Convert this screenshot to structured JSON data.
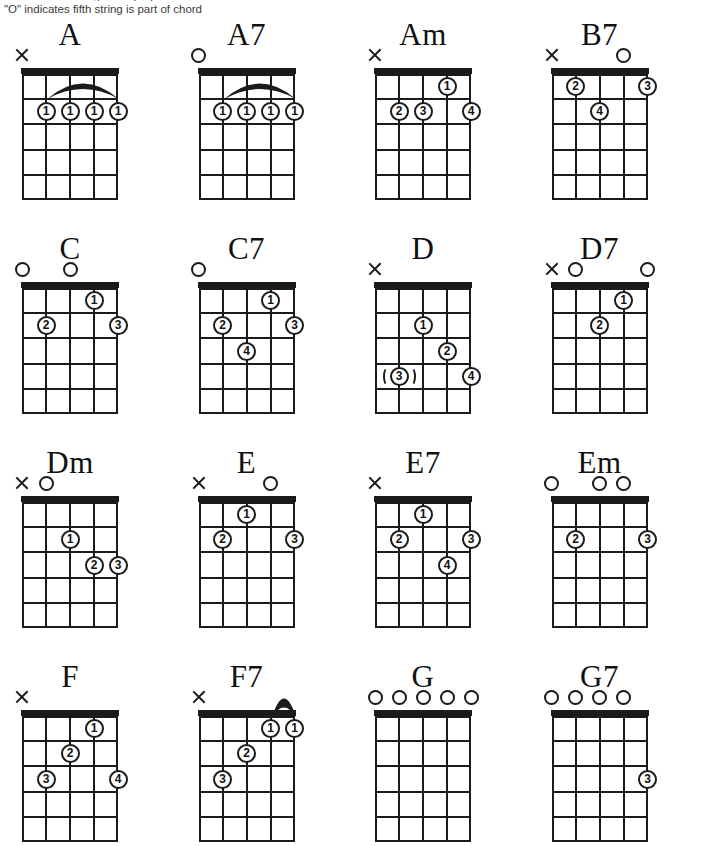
{
  "header": {
    "clipped_line": "\"X\" indicates string is not played",
    "note": "\"O\" indicates fifth string is part of chord"
  },
  "diagram_spec": {
    "strings": 5,
    "frets": 5,
    "marker_open": "O",
    "marker_mute": "X"
  },
  "chords": [
    {
      "name": "A",
      "top_markers": [
        {
          "string": 1,
          "type": "mute"
        }
      ],
      "fingers": [
        {
          "string": 2,
          "fret": 2,
          "label": "1"
        },
        {
          "string": 3,
          "fret": 2,
          "label": "1"
        },
        {
          "string": 4,
          "fret": 2,
          "label": "1"
        },
        {
          "string": 5,
          "fret": 2,
          "label": "1"
        }
      ],
      "barre": {
        "from_string": 2,
        "to_string": 5,
        "fret": 1
      }
    },
    {
      "name": "A7",
      "top_markers": [
        {
          "string": 1,
          "type": "open"
        }
      ],
      "fingers": [
        {
          "string": 2,
          "fret": 2,
          "label": "1"
        },
        {
          "string": 3,
          "fret": 2,
          "label": "1"
        },
        {
          "string": 4,
          "fret": 2,
          "label": "1"
        },
        {
          "string": 5,
          "fret": 2,
          "label": "1"
        }
      ],
      "barre": {
        "from_string": 2,
        "to_string": 5,
        "fret": 1
      }
    },
    {
      "name": "Am",
      "top_markers": [
        {
          "string": 1,
          "type": "mute"
        }
      ],
      "fingers": [
        {
          "string": 4,
          "fret": 1,
          "label": "1"
        },
        {
          "string": 2,
          "fret": 2,
          "label": "2"
        },
        {
          "string": 3,
          "fret": 2,
          "label": "3"
        },
        {
          "string": 5,
          "fret": 2,
          "label": "4"
        }
      ],
      "barre": null
    },
    {
      "name": "B7",
      "top_markers": [
        {
          "string": 1,
          "type": "mute"
        },
        {
          "string": 4,
          "type": "open"
        }
      ],
      "fingers": [
        {
          "string": 2,
          "fret": 1,
          "label": "2"
        },
        {
          "string": 5,
          "fret": 1,
          "label": "3"
        },
        {
          "string": 3,
          "fret": 2,
          "label": "4"
        }
      ],
      "barre": null
    },
    {
      "name": "C",
      "top_markers": [
        {
          "string": 1,
          "type": "open"
        },
        {
          "string": 3,
          "type": "open"
        }
      ],
      "fingers": [
        {
          "string": 4,
          "fret": 1,
          "label": "1"
        },
        {
          "string": 2,
          "fret": 2,
          "label": "2"
        },
        {
          "string": 5,
          "fret": 2,
          "label": "3"
        }
      ],
      "barre": null
    },
    {
      "name": "C7",
      "top_markers": [
        {
          "string": 1,
          "type": "open"
        }
      ],
      "fingers": [
        {
          "string": 4,
          "fret": 1,
          "label": "1"
        },
        {
          "string": 2,
          "fret": 2,
          "label": "2"
        },
        {
          "string": 5,
          "fret": 2,
          "label": "3"
        },
        {
          "string": 3,
          "fret": 3,
          "label": "4"
        }
      ],
      "barre": null
    },
    {
      "name": "D",
      "top_markers": [
        {
          "string": 1,
          "type": "mute"
        }
      ],
      "fingers": [
        {
          "string": 3,
          "fret": 2,
          "label": "1"
        },
        {
          "string": 4,
          "fret": 3,
          "label": "2"
        },
        {
          "string": 2,
          "fret": 4,
          "label": "3",
          "optional": true
        },
        {
          "string": 5,
          "fret": 4,
          "label": "4"
        }
      ],
      "barre": null
    },
    {
      "name": "D7",
      "top_markers": [
        {
          "string": 1,
          "type": "mute"
        },
        {
          "string": 2,
          "type": "open"
        },
        {
          "string": 5,
          "type": "open"
        }
      ],
      "fingers": [
        {
          "string": 4,
          "fret": 1,
          "label": "1"
        },
        {
          "string": 3,
          "fret": 2,
          "label": "2"
        }
      ],
      "barre": null
    },
    {
      "name": "Dm",
      "top_markers": [
        {
          "string": 1,
          "type": "mute"
        },
        {
          "string": 2,
          "type": "open"
        }
      ],
      "fingers": [
        {
          "string": 3,
          "fret": 2,
          "label": "1"
        },
        {
          "string": 4,
          "fret": 3,
          "label": "2"
        },
        {
          "string": 5,
          "fret": 3,
          "label": "3"
        }
      ],
      "barre": null
    },
    {
      "name": "E",
      "top_markers": [
        {
          "string": 1,
          "type": "mute"
        },
        {
          "string": 4,
          "type": "open"
        }
      ],
      "fingers": [
        {
          "string": 3,
          "fret": 1,
          "label": "1"
        },
        {
          "string": 2,
          "fret": 2,
          "label": "2"
        },
        {
          "string": 5,
          "fret": 2,
          "label": "3"
        }
      ],
      "barre": null
    },
    {
      "name": "E7",
      "top_markers": [
        {
          "string": 1,
          "type": "mute"
        }
      ],
      "fingers": [
        {
          "string": 3,
          "fret": 1,
          "label": "1"
        },
        {
          "string": 2,
          "fret": 2,
          "label": "2"
        },
        {
          "string": 5,
          "fret": 2,
          "label": "3"
        },
        {
          "string": 4,
          "fret": 3,
          "label": "4"
        }
      ],
      "barre": null
    },
    {
      "name": "Em",
      "top_markers": [
        {
          "string": 1,
          "type": "open"
        },
        {
          "string": 3,
          "type": "open"
        },
        {
          "string": 4,
          "type": "open"
        }
      ],
      "fingers": [
        {
          "string": 2,
          "fret": 2,
          "label": "2"
        },
        {
          "string": 5,
          "fret": 2,
          "label": "3"
        }
      ],
      "barre": null
    },
    {
      "name": "F",
      "top_markers": [
        {
          "string": 1,
          "type": "mute"
        }
      ],
      "fingers": [
        {
          "string": 4,
          "fret": 1,
          "label": "1"
        },
        {
          "string": 3,
          "fret": 2,
          "label": "2"
        },
        {
          "string": 2,
          "fret": 3,
          "label": "3"
        },
        {
          "string": 5,
          "fret": 3,
          "label": "4"
        }
      ],
      "barre": null
    },
    {
      "name": "F7",
      "top_markers": [
        {
          "string": 1,
          "type": "mute"
        }
      ],
      "fingers": [
        {
          "string": 4,
          "fret": 1,
          "label": "1"
        },
        {
          "string": 5,
          "fret": 1,
          "label": "1"
        },
        {
          "string": 3,
          "fret": 2,
          "label": "2"
        },
        {
          "string": 2,
          "fret": 3,
          "label": "3"
        }
      ],
      "barre": {
        "from_string": 4,
        "to_string": 5,
        "fret": 0
      }
    },
    {
      "name": "G",
      "top_markers": [
        {
          "string": 1,
          "type": "open"
        },
        {
          "string": 2,
          "type": "open"
        },
        {
          "string": 3,
          "type": "open"
        },
        {
          "string": 4,
          "type": "open"
        },
        {
          "string": 5,
          "type": "open"
        }
      ],
      "fingers": [],
      "barre": null
    },
    {
      "name": "G7",
      "top_markers": [
        {
          "string": 1,
          "type": "open"
        },
        {
          "string": 2,
          "type": "open"
        },
        {
          "string": 3,
          "type": "open"
        },
        {
          "string": 4,
          "type": "open"
        }
      ],
      "fingers": [
        {
          "string": 5,
          "fret": 3,
          "label": "3"
        }
      ],
      "barre": null
    }
  ]
}
